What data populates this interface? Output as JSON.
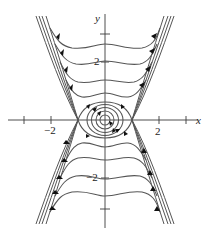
{
  "figure": {
    "type": "phase-portrait",
    "axes": {
      "x_label": "x",
      "y_label": "y",
      "x_tick_labels": [
        {
          "value": -2,
          "text": "−2"
        },
        {
          "value": 2,
          "text": "2"
        }
      ],
      "y_tick_labels": [
        {
          "value": 2,
          "text": "2"
        },
        {
          "value": -2,
          "text": "−2"
        }
      ],
      "x_ticks": [
        -3,
        -2,
        2,
        3
      ],
      "y_ticks": [
        3,
        2,
        -2,
        -3
      ]
    },
    "equilibria": [
      {
        "kind": "center",
        "x": 0,
        "y": 0
      },
      {
        "kind": "saddle",
        "x": -1,
        "y": 0
      },
      {
        "kind": "saddle",
        "x": 1,
        "y": 0
      }
    ],
    "colors": {
      "curve": "#555555",
      "axis": "#3a3a3a",
      "arrow": "#111111",
      "background": "#ffffff"
    }
  }
}
